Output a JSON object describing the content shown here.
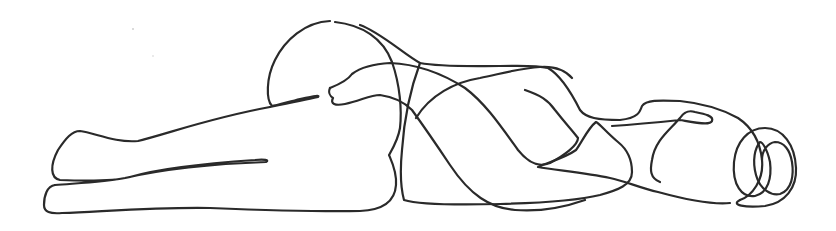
{
  "artwork": {
    "subject": "Continuous single-line drawing of a reclining figure lying on its side",
    "style": "black ink line on white background",
    "colors": {
      "background": "#ffffff",
      "ink": "#2a2a2a"
    }
  }
}
